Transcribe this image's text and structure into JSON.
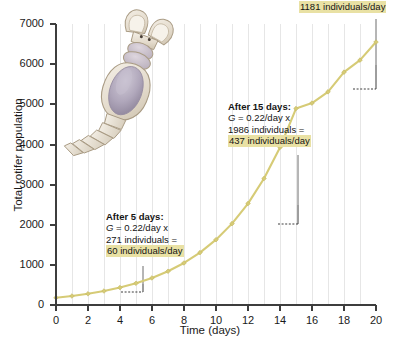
{
  "chart_data": {
    "type": "line",
    "title": "",
    "xlabel": "Time (days)",
    "ylabel": "Total rotifer population",
    "xlim": [
      0,
      20
    ],
    "ylim": [
      0,
      7000
    ],
    "xticks": [
      0,
      2,
      4,
      6,
      8,
      10,
      12,
      14,
      16,
      18,
      20
    ],
    "yticks": [
      0,
      1000,
      2000,
      3000,
      4000,
      5000,
      6000,
      7000
    ],
    "grid": "vertical gridlines every 1 day",
    "legend": "none",
    "series": [
      {
        "name": "Total rotifer population",
        "color": "#d6cb76",
        "marker": "diamond",
        "x": [
          0,
          1,
          2,
          3,
          4,
          5,
          6,
          7,
          8,
          9,
          10,
          11,
          12,
          13,
          14,
          15,
          16,
          17,
          18,
          19,
          20
        ],
        "values": [
          180,
          224,
          279,
          348,
          434,
          541,
          674,
          840,
          1047,
          1305,
          1627,
          2027,
          2527,
          3150,
          3926,
          4894,
          5030,
          5310,
          5800,
          6100,
          6550
        ]
      }
    ],
    "annotations": [
      {
        "name": "after-5-days",
        "day": 5,
        "population": 271,
        "growth_rate": "0.22/day",
        "result": "60 individuals/day",
        "lines": [
          "After 5 days:",
          "G = 0.22/day x",
          "271 individuals =",
          "60 individuals/day"
        ]
      },
      {
        "name": "after-15-days",
        "day": 15,
        "population": 1986,
        "growth_rate": "0.22/day",
        "result": "437 individuals/day",
        "lines": [
          "After 15 days:",
          "G = 0.22/day x",
          "1986 individuals =",
          "437 individuals/day"
        ]
      },
      {
        "name": "after-20-days",
        "day": 20,
        "population": 5367,
        "growth_rate": "0.22/day",
        "result": "1181 individuals/day",
        "lines": [
          "5367 individuals =",
          "1181 individuals/day"
        ]
      }
    ]
  },
  "axes": {
    "y_title": "Total rotifer population",
    "x_title": "Time (days)",
    "y_tick_labels": [
      "7000",
      "6000",
      "5000",
      "4000",
      "3000",
      "2000",
      "1000",
      "0"
    ],
    "x_tick_labels": [
      "0",
      "2",
      "4",
      "6",
      "8",
      "10",
      "12",
      "14",
      "16",
      "18",
      "20"
    ]
  },
  "annotation_5days": {
    "line1": "After 5 days:",
    "line2_italic": "G",
    "line2_rest": " = 0.22/day x",
    "line3": "271 individuals =",
    "line4_highlight": "60 individuals/day"
  },
  "annotation_15days": {
    "line1": "After 15 days:",
    "line2_italic": "G",
    "line2_rest": " = 0.22/day x",
    "line3": "1986 individuals =",
    "line4_highlight": "437 individuals/day"
  },
  "annotation_20days": {
    "line1": "5367 individuals =",
    "line2_highlight": "1181 individuals/day"
  },
  "illustration": {
    "name": "rotifer-illustration",
    "label": "rotifer"
  },
  "colors": {
    "curve": "#d6cb76",
    "highlight": "#e9e1a4",
    "axis": "#3d3d3d",
    "gridline": "#e4e4e4",
    "text": "#141414"
  }
}
